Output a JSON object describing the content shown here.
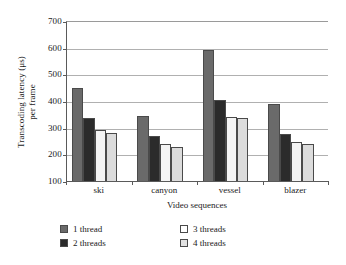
{
  "chart_data": {
    "type": "bar",
    "title": "",
    "xlabel": "Video sequences",
    "ylabel": "Transcoding latency (μs) per frame",
    "ylabel_line1": "Transcoding latency (μs)",
    "ylabel_line2": "per frame",
    "categories": [
      "ski",
      "canyon",
      "vessel",
      "blazer"
    ],
    "ylim": [
      100,
      700
    ],
    "yticks": [
      700,
      600,
      500,
      400,
      300,
      200,
      100
    ],
    "ytick_labels": [
      "700",
      "600",
      "500",
      "400",
      "300",
      "200",
      "100"
    ],
    "grid": true,
    "legend_position": "bottom",
    "series": [
      {
        "name": "1 thread",
        "color": "#6a6a6a",
        "values": [
          450,
          345,
          590,
          388
        ]
      },
      {
        "name": "2 threads",
        "color": "#2b2b2b",
        "values": [
          335,
          268,
          402,
          277
        ]
      },
      {
        "name": "3 threads",
        "color": "#f4f4f4",
        "values": [
          290,
          237,
          340,
          245
        ]
      },
      {
        "name": "4 threads",
        "color": "#dcdcdc",
        "values": [
          280,
          228,
          338,
          240
        ]
      }
    ]
  },
  "legend": {
    "column_left": [
      "1 thread",
      "2 threads"
    ],
    "column_right": [
      "3 threads",
      "4 threads"
    ]
  }
}
